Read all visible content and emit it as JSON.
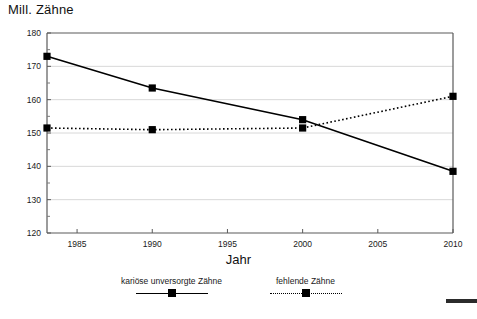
{
  "chart_data": {
    "type": "line",
    "title": "",
    "ylabel": "Mill. Zähne",
    "xlabel": "Jahr",
    "x": [
      1983,
      1990,
      2000,
      2010
    ],
    "xlim": [
      1983,
      2010
    ],
    "ylim": [
      120,
      180
    ],
    "xticks": [
      1985,
      1990,
      1995,
      2000,
      2005,
      2010
    ],
    "yticks": [
      120,
      130,
      140,
      150,
      160,
      170,
      180
    ],
    "xtick_labels": [
      "1985",
      "1990",
      "1995",
      "2000",
      "2005",
      "2010"
    ],
    "ytick_labels": [
      "120",
      "130",
      "140",
      "150",
      "160",
      "170",
      "180"
    ],
    "grid": "horizontal",
    "legend_position": "bottom",
    "series": [
      {
        "name": "kariöse unversorgte Zähne",
        "style": "solid",
        "marker": "square",
        "color": "#000000",
        "values": [
          173,
          163.5,
          154,
          138.5
        ]
      },
      {
        "name": "fehlende Zähne",
        "style": "dotted",
        "marker": "square",
        "color": "#000000",
        "values": [
          151.5,
          151,
          151.5,
          161
        ]
      }
    ]
  },
  "legend": {
    "entries": [
      {
        "label": "kariöse unversorgte Zähne",
        "style": "solid"
      },
      {
        "label": "fehlende Zähne",
        "style": "dotted"
      }
    ]
  }
}
